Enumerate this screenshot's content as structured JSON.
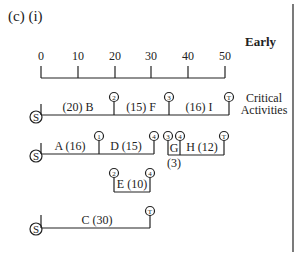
{
  "header": {
    "part_label": "(c) (i)",
    "mode_label": "Early"
  },
  "axis": {
    "ticks": [
      "0",
      "10",
      "20",
      "30",
      "40",
      "50"
    ],
    "values": [
      0,
      10,
      20,
      30,
      40,
      50
    ]
  },
  "side_label": {
    "line1": "Critical",
    "line2": "Activities"
  },
  "start_node": "S",
  "end_node": "T",
  "rows": [
    {
      "name": "critical-path",
      "activities": [
        {
          "label": "(20) B",
          "id": "B",
          "duration": 20,
          "start": 0,
          "end": 20,
          "end_node": "2"
        },
        {
          "label": "(15) F",
          "id": "F",
          "duration": 15,
          "start": 20,
          "end": 35,
          "end_node": "3"
        },
        {
          "label": "(16) I",
          "id": "I",
          "duration": 16,
          "start": 35,
          "end": 51,
          "end_node": "T"
        }
      ]
    },
    {
      "name": "path-a-d-g-h",
      "activities": [
        {
          "label": "A (16)",
          "id": "A",
          "duration": 16,
          "start": 0,
          "end": 16,
          "end_node": "1"
        },
        {
          "label": "D (15)",
          "id": "D",
          "duration": 15,
          "start": 16,
          "end": 31,
          "end_node": "4"
        },
        {
          "label": "G",
          "sub_label": "(3)",
          "id": "G",
          "duration": 3,
          "start": 35,
          "end": 38,
          "start_node": "3",
          "end_node": "4"
        },
        {
          "label": "H (12)",
          "id": "H",
          "duration": 12,
          "start": 38,
          "end": 50,
          "end_node": "T"
        }
      ]
    },
    {
      "name": "path-e",
      "activities": [
        {
          "label": "E (10)",
          "id": "E",
          "duration": 10,
          "start": 20,
          "end": 30,
          "start_node": "2",
          "end_node": "4"
        }
      ]
    },
    {
      "name": "path-c",
      "activities": [
        {
          "label": "C (30)",
          "id": "C",
          "duration": 30,
          "start": 0,
          "end": 30,
          "end_node": "T"
        }
      ]
    }
  ],
  "colors": {
    "ink": "#222222",
    "background": "#ffffff"
  }
}
